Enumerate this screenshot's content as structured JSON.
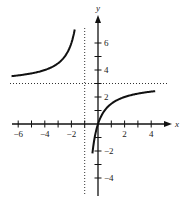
{
  "chart_data": {
    "type": "line",
    "title": "",
    "function": "y = 3x/(x+1)",
    "xlabel": "x",
    "ylabel": "y",
    "xlim": [
      -6.2,
      5.5
    ],
    "ylim": [
      -4.6,
      7.5
    ],
    "x_ticks": [
      -6,
      -5,
      -4,
      -3,
      -2,
      -1,
      1,
      2,
      3,
      4
    ],
    "x_tick_labels": [
      "-6",
      "-4",
      "-2",
      "2",
      "4"
    ],
    "x_tick_label_values": [
      -6,
      -4,
      -2,
      2,
      4
    ],
    "y_ticks": [
      -4,
      -3,
      -2,
      -1,
      1,
      2,
      3,
      4,
      5,
      6
    ],
    "y_tick_labels": [
      "-4",
      "-2",
      "2",
      "4",
      "6"
    ],
    "y_tick_label_values": [
      -4,
      -2,
      2,
      4,
      6
    ],
    "asymptotes": {
      "vertical": -1,
      "horizontal": 3
    },
    "grid": false,
    "legend": null,
    "series": [
      {
        "name": "left branch",
        "x": [
          -6,
          -5,
          -4,
          -3,
          -2.5,
          -2,
          -1.75
        ],
        "y": [
          3.6,
          3.75,
          4.0,
          4.5,
          5.0,
          6.0,
          7.0
        ]
      },
      {
        "name": "right branch",
        "x": [
          -0.4,
          -0.25,
          0,
          0.5,
          1,
          2,
          3,
          4
        ],
        "y": [
          -2.0,
          -1.0,
          0,
          1.0,
          1.5,
          2.0,
          2.25,
          2.4
        ]
      }
    ]
  },
  "axis": {
    "x_label": "x",
    "y_label": "y"
  }
}
